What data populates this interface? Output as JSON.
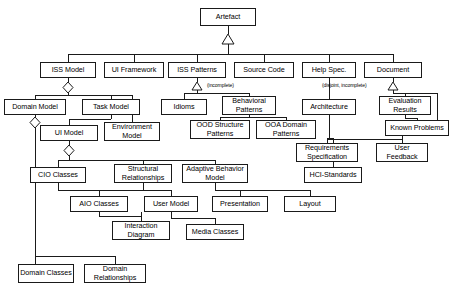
{
  "diagram": {
    "title": "Artefact",
    "type": "uml-class-hierarchy",
    "width": 458,
    "height": 296,
    "line_color": "#1a1a1a",
    "background": "#ffffff"
  },
  "nodes": [
    {
      "id": "artefact",
      "label": "Artefact",
      "x": 200,
      "y": 8,
      "w": 56,
      "h": 18
    },
    {
      "id": "iss_model",
      "label": "ISS Model",
      "x": 40,
      "y": 62,
      "w": 56,
      "h": 16
    },
    {
      "id": "ui_framework",
      "label": "UI Framework",
      "x": 104,
      "y": 62,
      "w": 60,
      "h": 16
    },
    {
      "id": "iss_patterns",
      "label": "ISS Patterns",
      "x": 168,
      "y": 62,
      "w": 58,
      "h": 16
    },
    {
      "id": "source_code",
      "label": "Source Code",
      "x": 234,
      "y": 62,
      "w": 60,
      "h": 16
    },
    {
      "id": "help_spec",
      "label": "Help Spec.",
      "x": 302,
      "y": 62,
      "w": 54,
      "h": 16
    },
    {
      "id": "document",
      "label": "Document",
      "x": 364,
      "y": 62,
      "w": 58,
      "h": 16
    },
    {
      "id": "domain_model",
      "label": "Domain Model",
      "x": 4,
      "y": 99,
      "w": 62,
      "h": 16
    },
    {
      "id": "task_model",
      "label": "Task Model",
      "x": 82,
      "y": 99,
      "w": 58,
      "h": 16
    },
    {
      "id": "idioms",
      "label": "Idioms",
      "x": 161,
      "y": 99,
      "w": 46,
      "h": 16
    },
    {
      "id": "behavioral_patterns",
      "label": "Behavioral Patterns",
      "x": 222,
      "y": 96,
      "w": 54,
      "h": 19
    },
    {
      "id": "architecture",
      "label": "Architecture",
      "x": 302,
      "y": 99,
      "w": 54,
      "h": 16
    },
    {
      "id": "evaluation_results",
      "label": "Evaluation Results",
      "x": 379,
      "y": 96,
      "w": 52,
      "h": 19
    },
    {
      "id": "ui_model",
      "label": "UI Model",
      "x": 40,
      "y": 125,
      "w": 58,
      "h": 16
    },
    {
      "id": "environment_model",
      "label": "Environment Model",
      "x": 104,
      "y": 122,
      "w": 56,
      "h": 19
    },
    {
      "id": "ood_structure_patterns",
      "label": "OOD Structure Patterns",
      "x": 190,
      "y": 120,
      "w": 60,
      "h": 19
    },
    {
      "id": "ooa_domain_patterns",
      "label": "OOA Domain Patterns",
      "x": 256,
      "y": 120,
      "w": 60,
      "h": 19
    },
    {
      "id": "known_problems",
      "label": "Known Problems",
      "x": 385,
      "y": 120,
      "w": 64,
      "h": 16
    },
    {
      "id": "requirements_specification",
      "label": "Requirements Specification",
      "x": 296,
      "y": 143,
      "w": 62,
      "h": 19
    },
    {
      "id": "user_feedback",
      "label": "User Feedback",
      "x": 376,
      "y": 143,
      "w": 52,
      "h": 19
    },
    {
      "id": "cio_classes",
      "label": "CIO Classes",
      "x": 30,
      "y": 167,
      "w": 56,
      "h": 16
    },
    {
      "id": "structural_relationships",
      "label": "Structural Relationships",
      "x": 114,
      "y": 164,
      "w": 58,
      "h": 19
    },
    {
      "id": "adaptive_behavior_model",
      "label": "Adaptive Behavior Model",
      "x": 182,
      "y": 164,
      "w": 66,
      "h": 19
    },
    {
      "id": "hci_standards",
      "label": "HCI-Standards",
      "x": 304,
      "y": 167,
      "w": 58,
      "h": 16
    },
    {
      "id": "aio_classes",
      "label": "AIO Classes",
      "x": 70,
      "y": 196,
      "w": 58,
      "h": 16
    },
    {
      "id": "user_model",
      "label": "User Model",
      "x": 144,
      "y": 196,
      "w": 54,
      "h": 16
    },
    {
      "id": "presentation",
      "label": "Presentation",
      "x": 212,
      "y": 196,
      "w": 56,
      "h": 16
    },
    {
      "id": "layout",
      "label": "Layout",
      "x": 284,
      "y": 196,
      "w": 52,
      "h": 16
    },
    {
      "id": "interaction_diagram",
      "label": "Interaction Diagram",
      "x": 112,
      "y": 221,
      "w": 58,
      "h": 19
    },
    {
      "id": "media_classes",
      "label": "Media Classes",
      "x": 186,
      "y": 224,
      "w": 58,
      "h": 16
    },
    {
      "id": "domain_classes",
      "label": "Domain Classes",
      "x": 18,
      "y": 264,
      "w": 56,
      "h": 19
    },
    {
      "id": "domain_relationships",
      "label": "Domain Relationships",
      "x": 84,
      "y": 264,
      "w": 62,
      "h": 19
    }
  ],
  "annotations": [
    {
      "id": "note_incomplete",
      "label": "(incomplete)",
      "x": 207,
      "y": 82
    },
    {
      "id": "note_disjoint_incomplete",
      "label": "(disjoint, incomplete)",
      "x": 322,
      "y": 82
    }
  ]
}
